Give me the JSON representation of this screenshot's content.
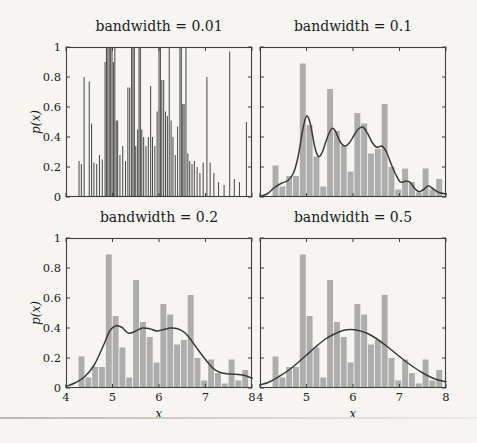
{
  "page": {
    "background": "#f6f5f2",
    "rule_color": "#c9c8c3"
  },
  "figure": {
    "xlabel": "x",
    "ylabel": "p(x)",
    "xlim": [
      4,
      8
    ],
    "ylim": [
      0,
      1
    ],
    "x_ticks": [
      4,
      5,
      6,
      7,
      8
    ],
    "x_tick_labels": [
      "4",
      "5",
      "6",
      "7",
      "8"
    ],
    "y_ticks": [
      0,
      0.2,
      0.4,
      0.6,
      0.8,
      1
    ],
    "y_tick_labels": [
      "0",
      "0.2",
      "0.4",
      "0.6",
      "0.8",
      "1"
    ],
    "bar_color": "#adadad",
    "curve_color": "#3a3a3a",
    "spike_color": "#4d4d4d",
    "frame_color": "#3f3f3f",
    "text_color": "#1c1c1c"
  },
  "chart_data": {
    "type": "bar",
    "subtype": "kde-bandwidth-comparison-grid",
    "grid": "2x2",
    "shared_histogram": {
      "bin_start": 4.26,
      "bin_width": 0.1467,
      "heights": [
        0.21,
        0.07,
        0.14,
        0.14,
        0.89,
        0.48,
        0.27,
        0.07,
        0.72,
        0.44,
        0.34,
        0.17,
        0.56,
        0.49,
        0.29,
        0.32,
        0.62,
        0.2,
        0.05,
        0.19,
        0.1,
        0.03,
        0.19,
        0.05,
        0.12
      ]
    },
    "panels": [
      {
        "type": "spikes",
        "title": "bandwidth = 0.01",
        "bandwidth": 0.01,
        "show_histogram": false,
        "show_y_tick_labels": true,
        "show_x_tick_labels": false,
        "spikes": [
          [
            4.28,
            0.24
          ],
          [
            4.33,
            0.22
          ],
          [
            4.39,
            0.8
          ],
          [
            4.5,
            0.77
          ],
          [
            4.55,
            0.49
          ],
          [
            4.6,
            0.23
          ],
          [
            4.66,
            0.22
          ],
          [
            4.72,
            0.28
          ],
          [
            4.78,
            0.25
          ],
          [
            4.84,
            0.9
          ],
          [
            4.87,
            1.0
          ],
          [
            4.9,
            1.0
          ],
          [
            4.93,
            1.0
          ],
          [
            4.96,
            1.0
          ],
          [
            4.99,
            1.0
          ],
          [
            5.02,
            0.9
          ],
          [
            5.05,
            1.0
          ],
          [
            5.08,
            0.51
          ],
          [
            5.11,
            0.51
          ],
          [
            5.16,
            0.28
          ],
          [
            5.22,
            0.34
          ],
          [
            5.28,
            0.24
          ],
          [
            5.33,
            0.73
          ],
          [
            5.37,
            0.73
          ],
          [
            5.41,
            1.0
          ],
          [
            5.44,
            1.0
          ],
          [
            5.47,
            1.0
          ],
          [
            5.5,
            0.34
          ],
          [
            5.54,
            0.45
          ],
          [
            5.57,
            1.0
          ],
          [
            5.6,
            1.0
          ],
          [
            5.63,
            0.45
          ],
          [
            5.67,
            0.4
          ],
          [
            5.72,
            0.34
          ],
          [
            5.77,
            0.4
          ],
          [
            5.82,
            0.74
          ],
          [
            5.86,
            0.4
          ],
          [
            5.91,
            0.34
          ],
          [
            5.96,
            0.57
          ],
          [
            6.0,
            1.0
          ],
          [
            6.03,
            1.0
          ],
          [
            6.06,
            0.78
          ],
          [
            6.1,
            0.78
          ],
          [
            6.14,
            0.57
          ],
          [
            6.18,
            0.54
          ],
          [
            6.22,
            1.0
          ],
          [
            6.26,
            0.51
          ],
          [
            6.3,
            0.4
          ],
          [
            6.35,
            0.28
          ],
          [
            6.4,
            0.47
          ],
          [
            6.45,
            1.0
          ],
          [
            6.48,
            1.0
          ],
          [
            6.51,
            0.62
          ],
          [
            6.54,
            0.62
          ],
          [
            6.58,
            1.0
          ],
          [
            6.62,
            0.29
          ],
          [
            6.66,
            0.24
          ],
          [
            6.71,
            0.22
          ],
          [
            6.76,
            0.24
          ],
          [
            6.82,
            0.2
          ],
          [
            6.88,
            0.16
          ],
          [
            6.95,
            0.23
          ],
          [
            7.03,
            0.8
          ],
          [
            7.1,
            0.23
          ],
          [
            7.18,
            0.16
          ],
          [
            7.28,
            0.1
          ],
          [
            7.4,
            0.08
          ],
          [
            7.52,
            0.97
          ],
          [
            7.62,
            0.12
          ],
          [
            7.73,
            0.1
          ],
          [
            7.88,
            0.5
          ]
        ]
      },
      {
        "type": "bar+line",
        "title": "bandwidth = 0.1",
        "bandwidth": 0.1,
        "show_histogram": true,
        "show_y_tick_labels": false,
        "show_x_tick_labels": false,
        "curve": [
          [
            4.0,
            0.005
          ],
          [
            4.15,
            0.02
          ],
          [
            4.3,
            0.06
          ],
          [
            4.45,
            0.09
          ],
          [
            4.6,
            0.11
          ],
          [
            4.72,
            0.16
          ],
          [
            4.82,
            0.27
          ],
          [
            4.92,
            0.45
          ],
          [
            5.0,
            0.54
          ],
          [
            5.08,
            0.49
          ],
          [
            5.18,
            0.33
          ],
          [
            5.26,
            0.27
          ],
          [
            5.34,
            0.3
          ],
          [
            5.44,
            0.39
          ],
          [
            5.54,
            0.455
          ],
          [
            5.62,
            0.44
          ],
          [
            5.72,
            0.37
          ],
          [
            5.82,
            0.34
          ],
          [
            5.92,
            0.36
          ],
          [
            6.02,
            0.41
          ],
          [
            6.12,
            0.455
          ],
          [
            6.22,
            0.465
          ],
          [
            6.32,
            0.42
          ],
          [
            6.42,
            0.36
          ],
          [
            6.52,
            0.33
          ],
          [
            6.62,
            0.34
          ],
          [
            6.72,
            0.3
          ],
          [
            6.82,
            0.22
          ],
          [
            6.92,
            0.15
          ],
          [
            7.02,
            0.1
          ],
          [
            7.12,
            0.105
          ],
          [
            7.22,
            0.1
          ],
          [
            7.32,
            0.06
          ],
          [
            7.42,
            0.035
          ],
          [
            7.52,
            0.05
          ],
          [
            7.62,
            0.075
          ],
          [
            7.72,
            0.055
          ],
          [
            7.85,
            0.03
          ],
          [
            8.0,
            0.02
          ]
        ]
      },
      {
        "type": "bar+line",
        "title": "bandwidth = 0.2",
        "bandwidth": 0.2,
        "show_histogram": true,
        "show_y_tick_labels": true,
        "show_x_tick_labels": true,
        "curve": [
          [
            4.0,
            0.01
          ],
          [
            4.2,
            0.035
          ],
          [
            4.4,
            0.075
          ],
          [
            4.6,
            0.15
          ],
          [
            4.8,
            0.28
          ],
          [
            4.95,
            0.385
          ],
          [
            5.08,
            0.415
          ],
          [
            5.2,
            0.405
          ],
          [
            5.35,
            0.365
          ],
          [
            5.5,
            0.38
          ],
          [
            5.65,
            0.4
          ],
          [
            5.8,
            0.395
          ],
          [
            5.95,
            0.38
          ],
          [
            6.1,
            0.39
          ],
          [
            6.25,
            0.4
          ],
          [
            6.4,
            0.395
          ],
          [
            6.55,
            0.37
          ],
          [
            6.7,
            0.315
          ],
          [
            6.85,
            0.25
          ],
          [
            7.0,
            0.19
          ],
          [
            7.15,
            0.135
          ],
          [
            7.3,
            0.105
          ],
          [
            7.45,
            0.095
          ],
          [
            7.6,
            0.092
          ],
          [
            7.75,
            0.088
          ],
          [
            7.88,
            0.08
          ],
          [
            8.0,
            0.065
          ]
        ]
      },
      {
        "type": "bar+line",
        "title": "bandwidth = 0.5",
        "bandwidth": 0.5,
        "show_histogram": true,
        "show_y_tick_labels": false,
        "show_x_tick_labels": true,
        "curve": [
          [
            4.0,
            0.02
          ],
          [
            4.2,
            0.04
          ],
          [
            4.4,
            0.075
          ],
          [
            4.6,
            0.115
          ],
          [
            4.8,
            0.165
          ],
          [
            5.0,
            0.22
          ],
          [
            5.2,
            0.275
          ],
          [
            5.4,
            0.325
          ],
          [
            5.6,
            0.36
          ],
          [
            5.8,
            0.385
          ],
          [
            5.95,
            0.39
          ],
          [
            6.1,
            0.385
          ],
          [
            6.3,
            0.365
          ],
          [
            6.5,
            0.33
          ],
          [
            6.7,
            0.285
          ],
          [
            6.9,
            0.235
          ],
          [
            7.1,
            0.185
          ],
          [
            7.3,
            0.14
          ],
          [
            7.5,
            0.1
          ],
          [
            7.7,
            0.068
          ],
          [
            7.85,
            0.052
          ],
          [
            8.0,
            0.042
          ]
        ]
      }
    ]
  }
}
